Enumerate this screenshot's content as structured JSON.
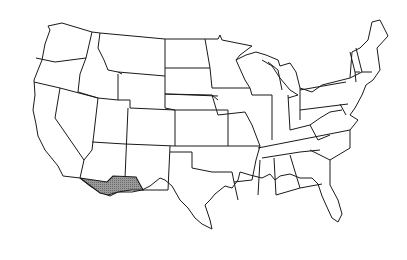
{
  "map": {
    "type": "outline map",
    "region": "Contiguous United States",
    "highlighted_region": {
      "name": "Gadsden Purchase",
      "location": "Southern Arizona and southwestern New Mexico",
      "fill_color": "#8a8a8a"
    },
    "colors": {
      "background": "#ffffff",
      "state_fill": "#ffffff",
      "border": "#1a1a1a"
    }
  }
}
